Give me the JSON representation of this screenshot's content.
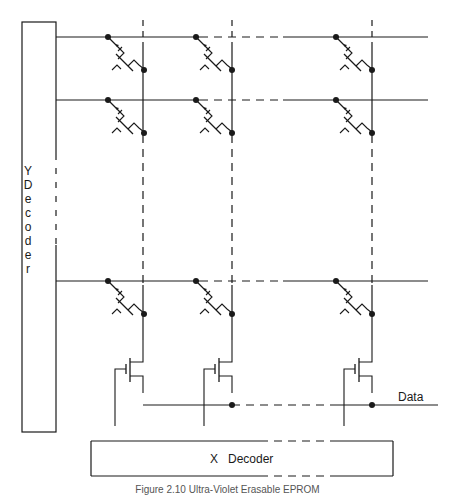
{
  "diagram": {
    "y_decoder": {
      "label": "Y\nD\ne\nc\no\nd\ne\nr"
    },
    "x_decoder": {
      "label": "X   Decoder"
    },
    "data_label": "Data",
    "caption": "Figure 2.10  Ultra-Violet Erasable EPROM",
    "word_lines": [
      40,
      101,
      282
    ],
    "bit_line_columns": [
      146,
      233,
      373
    ],
    "colors": {
      "line": "#1a1a1a",
      "background": "#ffffff"
    }
  }
}
